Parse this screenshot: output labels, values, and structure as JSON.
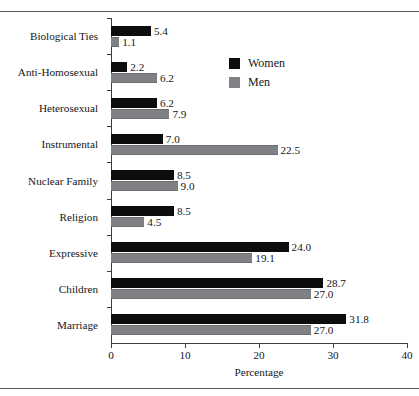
{
  "figure": {
    "caption_fragment": "",
    "top_rule_color": "#555a5e",
    "bottom_rule_color": "#555a5e"
  },
  "legend": {
    "position": "top-right",
    "entries": [
      {
        "label": "Women",
        "color": "#0d0d0d",
        "swatch_name": "legend-swatch-women"
      },
      {
        "label": "Men",
        "color": "#7f8184",
        "swatch_name": "legend-swatch-men"
      }
    ]
  },
  "chart_data": {
    "type": "bar",
    "orientation": "horizontal",
    "title": "",
    "subtitle": "",
    "xlabel": "Percentage",
    "ylabel": "",
    "xlim": [
      0,
      40
    ],
    "xticks": [
      0,
      10,
      20,
      30,
      40
    ],
    "xticklabels": [
      "0",
      "10",
      "20",
      "30",
      "40"
    ],
    "grid": false,
    "legend_position": "upper right",
    "categories": [
      "Biological Ties",
      "Anti-Homosexual",
      "Heterosexual",
      "Instrumental",
      "Nuclear Family",
      "Religion",
      "Expressive",
      "Children",
      "Marriage"
    ],
    "series": [
      {
        "name": "Women",
        "color": "#0d0d0d",
        "values": [
          5.4,
          2.2,
          6.2,
          7.0,
          8.5,
          8.5,
          24.0,
          28.7,
          31.8
        ],
        "labels": [
          "5.4",
          "2.2",
          "6.2",
          "7.0",
          "8.5",
          "8.5",
          "24.0",
          "28.7",
          "31.8"
        ]
      },
      {
        "name": "Men",
        "color": "#7f8184",
        "values": [
          1.1,
          6.2,
          7.9,
          22.5,
          9.0,
          4.5,
          19.1,
          27.0,
          27.0
        ],
        "labels": [
          "1.1",
          "6.2",
          "7.9",
          "22.5",
          "9.0",
          "4.5",
          "19.1",
          "27.0",
          "27.0"
        ]
      }
    ]
  }
}
